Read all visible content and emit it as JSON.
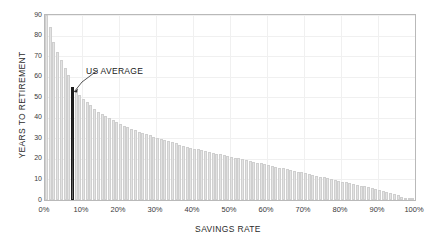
{
  "chart_data": {
    "type": "bar",
    "title": "",
    "xlabel": "SAVINGS RATE",
    "ylabel": "YEARS TO RETIREMENT",
    "xlim": [
      0,
      100
    ],
    "ylim": [
      0,
      90
    ],
    "grid": true,
    "legend": null,
    "xtick_labels": [
      "0%",
      "10%",
      "20%",
      "30%",
      "40%",
      "50%",
      "60%",
      "70%",
      "80%",
      "90%",
      "100%"
    ],
    "xtick_values": [
      0,
      10,
      20,
      30,
      40,
      50,
      60,
      70,
      80,
      90,
      100
    ],
    "ytick_labels": [
      "0",
      "10",
      "20",
      "30",
      "40",
      "50",
      "60",
      "70",
      "80",
      "90"
    ],
    "ytick_values": [
      0,
      10,
      20,
      30,
      40,
      50,
      60,
      70,
      80,
      90
    ],
    "bar_color": "#e3e3e3",
    "highlight_color": "#1a1a1a",
    "annotations": [
      {
        "text": "US AVERAGE",
        "points_to_x": 7,
        "points_to_y": 55
      }
    ],
    "categories": [
      1,
      2,
      3,
      4,
      5,
      6,
      7,
      8,
      9,
      10,
      11,
      12,
      13,
      14,
      15,
      16,
      17,
      18,
      19,
      20,
      21,
      22,
      23,
      24,
      25,
      26,
      27,
      28,
      29,
      30,
      31,
      32,
      33,
      34,
      35,
      36,
      37,
      38,
      39,
      40,
      41,
      42,
      43,
      44,
      45,
      46,
      47,
      48,
      49,
      50,
      51,
      52,
      53,
      54,
      55,
      56,
      57,
      58,
      59,
      60,
      61,
      62,
      63,
      64,
      65,
      66,
      67,
      68,
      69,
      70,
      71,
      72,
      73,
      74,
      75,
      76,
      77,
      78,
      79,
      80,
      81,
      82,
      83,
      84,
      85,
      86,
      87,
      88,
      89,
      90,
      91,
      92,
      93,
      94,
      95,
      96,
      97,
      98,
      99,
      100
    ],
    "values": [
      90,
      84,
      77,
      72,
      68,
      64,
      61,
      55,
      53,
      51,
      49,
      47.5,
      46,
      44.5,
      43,
      42,
      41,
      40,
      39,
      38,
      37,
      36.2,
      35.4,
      34.6,
      34,
      33.3,
      32.6,
      32,
      31.4,
      30.8,
      30.2,
      29.6,
      29,
      28.5,
      28,
      27.5,
      27,
      26.5,
      26,
      25.5,
      25,
      24.6,
      24.2,
      23.8,
      23.4,
      23,
      22.6,
      22.2,
      21.8,
      21.4,
      21,
      20.6,
      20.2,
      19.8,
      19.4,
      19,
      18.6,
      18.2,
      17.8,
      17.4,
      17,
      16.6,
      16.2,
      15.8,
      15.4,
      15,
      14.6,
      14.2,
      13.8,
      13.4,
      13,
      12.6,
      12.2,
      11.8,
      11.4,
      11,
      10.6,
      10.2,
      9.8,
      9.4,
      9,
      8.6,
      8.2,
      7.8,
      7.4,
      7,
      6.6,
      6.2,
      5.8,
      5.4,
      5,
      4.5,
      4,
      3.4,
      2.8,
      2.2,
      1.6,
      1.1,
      0.6,
      0.2
    ],
    "highlight_index": 7
  }
}
